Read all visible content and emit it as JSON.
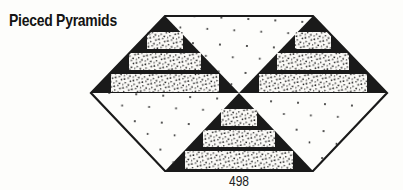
{
  "page": {
    "title": "Pieced Pyramids",
    "pattern_number": "498"
  },
  "figure": {
    "kind": "quilt-block-illustration",
    "pyramid_triangles": 3,
    "steps_per_pyramid": 3,
    "plain_dotted_triangles": 3
  },
  "colors": {
    "ink": "#1a1a1a",
    "paper": "#fdfdfb",
    "step_fill": "#fbfaf7",
    "dot": "#1c1c1c"
  }
}
